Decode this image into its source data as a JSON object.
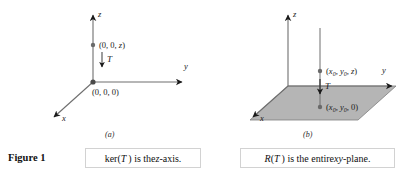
{
  "figure": {
    "number_label": "Figure 1"
  },
  "panels": [
    {
      "id": "a",
      "sublabel": "(a)",
      "axes": {
        "x": "x",
        "y": "y",
        "z": "z"
      },
      "points": [
        {
          "name": "upper-point",
          "label": "(0, 0, z)"
        },
        {
          "name": "origin-point",
          "label": "(0, 0, 0)"
        }
      ],
      "map_arrow_label": "T",
      "caption": "ker(T ) is the z-axis."
    },
    {
      "id": "b",
      "sublabel": "(b)",
      "axes": {
        "x": "x",
        "y": "y",
        "z": "z"
      },
      "points": [
        {
          "name": "upper-point",
          "label": "(x0, y0, z)"
        },
        {
          "name": "projected-point",
          "label": "(x0, y0, 0)"
        }
      ],
      "map_arrow_label": "T",
      "caption": "R(T ) is the entire xy-plane.",
      "plane_fill": "#b5b5b5"
    }
  ],
  "colors": {
    "line": "#6f6f6f",
    "arrowhead": "#1a1a1a",
    "plane": "#b5b5b5",
    "text": "#111111",
    "caption_border": "#d2d2d2"
  }
}
